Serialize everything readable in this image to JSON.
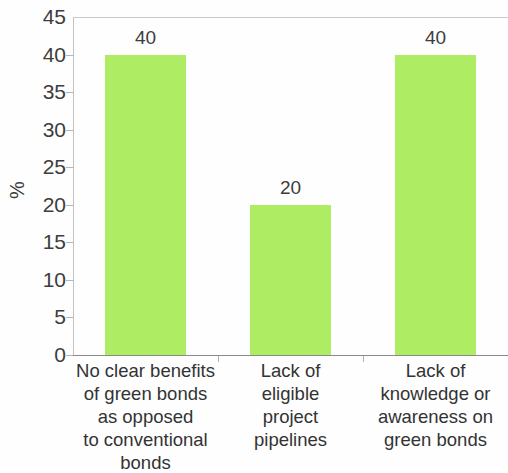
{
  "chart_data": {
    "type": "bar",
    "title": "",
    "xlabel": "",
    "ylabel": "%",
    "ylim": [
      0,
      45
    ],
    "ytick_step": 5,
    "yticks": [
      45,
      40,
      35,
      30,
      25,
      20,
      15,
      10,
      5,
      0
    ],
    "grid": false,
    "legend": null,
    "bar_color": "#aeed63",
    "text_color": "#3d3d3d",
    "axis_color": "#8a8a8a",
    "categories": [
      "No clear benefits of green bonds as opposed to conventional bonds",
      "Lack of eligible project pipelines",
      "Lack of knowledge or awareness on green bonds"
    ],
    "category_lines": [
      [
        "No clear benefits",
        "of green bonds",
        "as opposed",
        "to conventional",
        "bonds"
      ],
      [
        "Lack of",
        "eligible",
        "project",
        "pipelines"
      ],
      [
        "Lack of",
        "knowledge or",
        "awareness on",
        "green bonds"
      ]
    ],
    "values": [
      40,
      20,
      40
    ],
    "data_labels": [
      "40",
      "20",
      "40"
    ]
  }
}
